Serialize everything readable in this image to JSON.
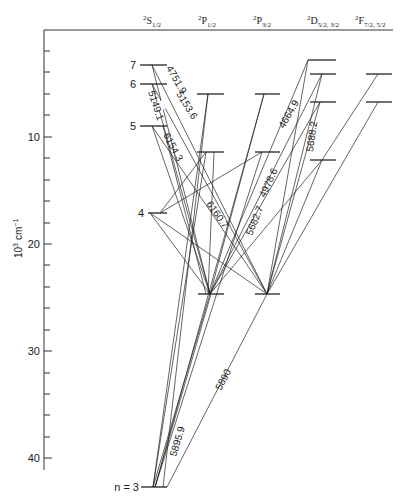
{
  "diagram": {
    "type": "grotrian-diagram",
    "y_axis": {
      "label": "10³ cm⁻¹",
      "label_base": "10",
      "label_exp": "3",
      "label_unit": "cm",
      "label_unit_exp": "−1",
      "ticks": [
        "10",
        "20",
        "30",
        "40"
      ],
      "tick_values": [
        10,
        20,
        30,
        40
      ],
      "minor_step": 2
    },
    "columns": [
      {
        "id": "S",
        "sup": "2",
        "letter": "S",
        "sub": "1/2"
      },
      {
        "id": "P12",
        "sup": "2",
        "letter": "P",
        "sub": "1/2"
      },
      {
        "id": "P32",
        "sup": "2",
        "letter": "P",
        "sub": "3/2"
      },
      {
        "id": "D",
        "sup": "2",
        "letter": "D",
        "sub": "5/2, 3/2"
      },
      {
        "id": "F",
        "sup": "2",
        "letter": "F",
        "sub": "7/2, 5/2"
      }
    ],
    "level_labels": {
      "n7": "7",
      "n6": "6",
      "n5": "5",
      "n4": "4",
      "ground": "n = 3"
    },
    "wavelength_labels": [
      {
        "id": "w5149",
        "text": "5149.1"
      },
      {
        "id": "w4751",
        "text": "4751.9"
      },
      {
        "id": "w5153",
        "text": "5153.6"
      },
      {
        "id": "w6154",
        "text": "6154.3"
      },
      {
        "id": "w6160",
        "text": "6160.7"
      },
      {
        "id": "w5682",
        "text": "5682.7"
      },
      {
        "id": "w4978",
        "text": "4978.6"
      },
      {
        "id": "w4664",
        "text": "4664.9"
      },
      {
        "id": "w5688",
        "text": "5688.2"
      },
      {
        "id": "w5895",
        "text": "5895.9"
      },
      {
        "id": "w5890",
        "text": "5890"
      }
    ]
  }
}
